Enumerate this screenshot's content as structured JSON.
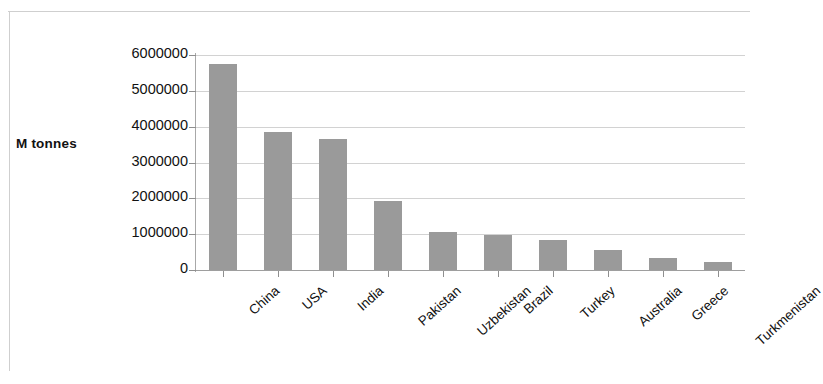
{
  "chart_data": {
    "type": "bar",
    "title": "",
    "xlabel": "",
    "ylabel": "M tonnes",
    "ylim": [
      0,
      6000000
    ],
    "ytick_labels": [
      "6000000",
      "5000000",
      "4000000",
      "3000000",
      "2000000",
      "1000000",
      "0"
    ],
    "ytick_values": [
      6000000,
      5000000,
      4000000,
      3000000,
      2000000,
      1000000,
      0
    ],
    "grid": true,
    "legend": "none",
    "categories": [
      "China",
      "USA",
      "India",
      "Pakistan",
      "Uzbekistan",
      "Brazil",
      "Turkey",
      "Australia",
      "Greece",
      "Turkmenistan"
    ],
    "values": [
      5750000,
      3850000,
      3670000,
      1920000,
      1060000,
      970000,
      850000,
      550000,
      330000,
      230000
    ],
    "bar_color": "#9a9a9a",
    "gridline_color": "#d2d2d2",
    "axis_color": "#8f8f8f",
    "background_color": "#ffffff"
  }
}
